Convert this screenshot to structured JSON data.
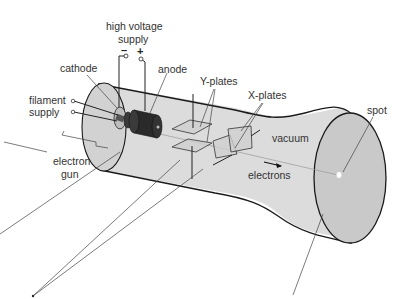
{
  "diagram": {
    "labels": {
      "high_voltage_supply_line1": "high voltage",
      "high_voltage_supply_line2": "supply",
      "negative_terminal": "–",
      "positive_terminal": "+",
      "cathode": "cathode",
      "anode": "anode",
      "filament_supply_line1": "filament",
      "filament_supply_line2": "supply",
      "electron_gun_line1": "electron",
      "electron_gun_line2": "gun",
      "y_plates": "Y-plates",
      "x_plates": "X-plates",
      "vacuum": "vacuum",
      "electrons": "electrons",
      "spot": "spot"
    },
    "colors": {
      "tube_fill": "#dcdcdc",
      "screen_fill": "#c9c9c9",
      "gun_dark": "#2a2a2a",
      "outline": "#1a1a1a",
      "text": "#333333"
    }
  }
}
